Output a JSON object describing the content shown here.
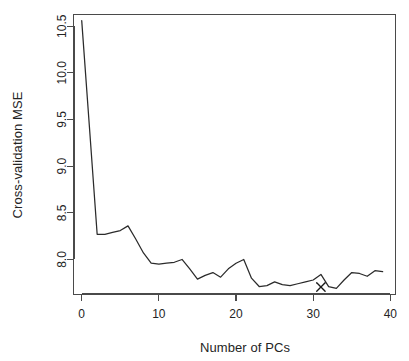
{
  "figure": {
    "background_color": "#ffffff",
    "line_color": "#2b2b2b",
    "axis_color": "#4a4a4a",
    "text_color": "#242424"
  },
  "chart_data": {
    "type": "line",
    "title": "",
    "subtitle": "",
    "xlabel": "Number of PCs",
    "ylabel": "Cross-validation MSE",
    "xlim": [
      -1.0,
      40.6
    ],
    "ylim": [
      7.63,
      10.62
    ],
    "grid": false,
    "legend": null,
    "x_ticks": [
      0,
      10,
      20,
      30,
      40
    ],
    "x_tick_labels": [
      "0",
      "10",
      "20",
      "30",
      "40"
    ],
    "y_ticks": [
      8.0,
      8.5,
      9.0,
      9.5,
      10.0,
      10.5
    ],
    "y_tick_labels": [
      "8.0",
      "8.5",
      "9.0",
      "9.5",
      "10.0",
      "10.5"
    ],
    "x": [
      0,
      1,
      2,
      3,
      4,
      5,
      6,
      7,
      8,
      9,
      10,
      11,
      12,
      13,
      14,
      15,
      16,
      17,
      18,
      19,
      20,
      21,
      22,
      23,
      24,
      25,
      26,
      27,
      28,
      29,
      30,
      31,
      32,
      33,
      34,
      35,
      36,
      37,
      38,
      39
    ],
    "values": [
      10.56,
      9.42,
      8.27,
      8.27,
      8.29,
      8.31,
      8.36,
      8.22,
      8.07,
      7.96,
      7.95,
      7.96,
      7.97,
      8.0,
      7.9,
      7.79,
      7.83,
      7.86,
      7.81,
      7.9,
      7.96,
      8.0,
      7.8,
      7.71,
      7.72,
      7.76,
      7.73,
      7.72,
      7.74,
      7.76,
      7.78,
      7.84,
      7.71,
      7.69,
      7.78,
      7.86,
      7.85,
      7.82,
      7.88,
      7.87
    ],
    "series": [
      {
        "name": "Cross-validation MSE",
        "values": [
          10.56,
          9.42,
          8.27,
          8.27,
          8.29,
          8.31,
          8.36,
          8.22,
          8.07,
          7.96,
          7.95,
          7.96,
          7.97,
          8.0,
          7.9,
          7.79,
          7.83,
          7.86,
          7.81,
          7.9,
          7.96,
          8.0,
          7.8,
          7.71,
          7.72,
          7.76,
          7.73,
          7.72,
          7.74,
          7.76,
          7.78,
          7.84,
          7.71,
          7.69,
          7.78,
          7.86,
          7.85,
          7.82,
          7.88,
          7.87
        ]
      }
    ],
    "annotations": [
      {
        "kind": "marker",
        "symbol": "x",
        "label": "",
        "x": 31,
        "y": 7.705
      }
    ]
  }
}
